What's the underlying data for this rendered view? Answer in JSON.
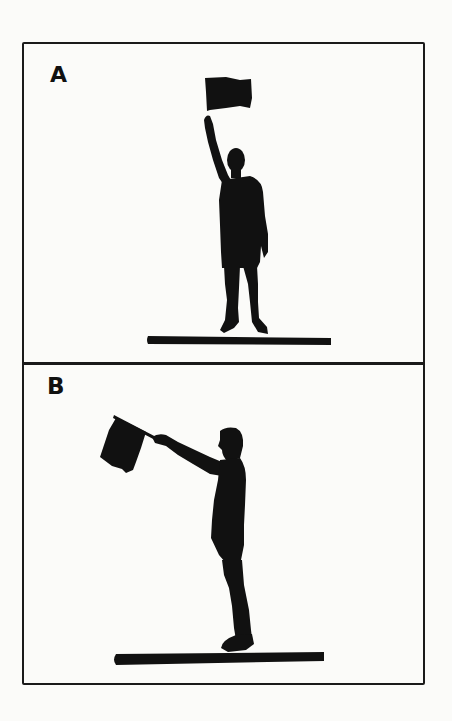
{
  "figure": {
    "panels": [
      {
        "label": "A",
        "description": "Figure standing facing forward holding flag straight up overhead"
      },
      {
        "label": "B",
        "description": "Figure standing in profile holding flag extended forward and up at an angle"
      }
    ],
    "colors": {
      "ink": "#111111",
      "background": "#fbfbf9",
      "border": "#1a1a1a"
    }
  }
}
